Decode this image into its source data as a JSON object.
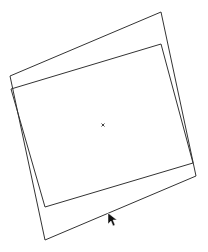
{
  "canvas": {
    "width": 208,
    "height": 252,
    "background": "#ffffff",
    "stroke_color": "#333333"
  },
  "shapes": {
    "outer_rect": {
      "points": "10,76 161,12 196,176 45,240"
    },
    "inner_rect": {
      "points": "11,89 161,44 193,163 45,207"
    },
    "center_mark": {
      "x": 103,
      "y": 125,
      "glyph": "×"
    }
  },
  "cursor": {
    "x": 108,
    "y": 213,
    "icon": "arrow-pointer-icon"
  }
}
